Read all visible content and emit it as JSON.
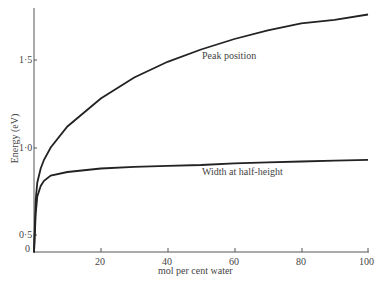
{
  "chart_data": {
    "type": "line",
    "title": "",
    "xlabel": "mol per cent water",
    "ylabel": "Energy (eV)",
    "xlim": [
      0,
      100
    ],
    "ylim": [
      0.4,
      1.8
    ],
    "xticks": [
      "0",
      "20",
      "40",
      "60",
      "80",
      "100"
    ],
    "yticks": [
      "0·5",
      "1·0",
      "1·5"
    ],
    "grid": false,
    "legend": "none (curves annotated inline)",
    "x": [
      0,
      0.5,
      1,
      2,
      3,
      5,
      10,
      20,
      30,
      40,
      50,
      60,
      70,
      80,
      90,
      100
    ],
    "series": [
      {
        "name": "Peak position",
        "values": [
          0.4,
          0.7,
          0.8,
          0.88,
          0.93,
          1.0,
          1.12,
          1.28,
          1.4,
          1.49,
          1.56,
          1.62,
          1.67,
          1.71,
          1.73,
          1.76
        ]
      },
      {
        "name": "Width at half-height",
        "values": [
          0.4,
          0.62,
          0.72,
          0.78,
          0.81,
          0.84,
          0.86,
          0.88,
          0.89,
          0.895,
          0.9,
          0.91,
          0.915,
          0.92,
          0.925,
          0.93
        ]
      }
    ],
    "annotations": [
      "Peak position",
      "Width at half-height"
    ]
  },
  "labels": {
    "xlabel": "mol per cent water",
    "ylabel": "Energy (eV)",
    "peak": "Peak position",
    "width": "Width at half-height",
    "xt0": "0",
    "xt1": "20",
    "xt2": "40",
    "xt3": "60",
    "xt4": "80",
    "xt5": "100",
    "yt0": "0·5",
    "yt1": "1·0",
    "yt2": "1·5"
  }
}
